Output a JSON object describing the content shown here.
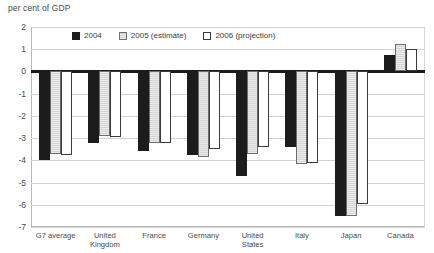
{
  "chart_data": {
    "type": "bar",
    "title": "",
    "ylabel": "per cent of GDP",
    "xlabel": "",
    "ylim": [
      -7,
      2
    ],
    "yticks": [
      2,
      1,
      0,
      -1,
      -2,
      -3,
      -4,
      -5,
      -6,
      -7
    ],
    "grid": true,
    "legend_position": "top-inside",
    "categories": [
      "G7 average",
      "United\nKingdom",
      "France",
      "Germany",
      "United\nStates",
      "Italy",
      "Japan",
      "Canada"
    ],
    "series": [
      {
        "name": "2004",
        "color": "#1c1c1c",
        "values": [
          -4.0,
          -3.2,
          -3.6,
          -3.75,
          -4.7,
          -3.4,
          -6.5,
          0.75
        ]
      },
      {
        "name": "2005 (estimate)",
        "color": "#d5d5d5",
        "values": [
          -3.7,
          -2.9,
          -3.2,
          -3.85,
          -3.7,
          -4.15,
          -6.5,
          1.25
        ]
      },
      {
        "name": "2006 (projection)",
        "color": "#ffffff",
        "values": [
          -3.75,
          -2.95,
          -3.2,
          -3.5,
          -3.4,
          -4.1,
          -5.95,
          1.0
        ]
      }
    ]
  }
}
